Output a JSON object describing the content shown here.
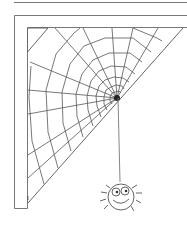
{
  "illustration": {
    "subject": "spider web in a corner with a hanging spider",
    "colors": {
      "background": "#ffffff",
      "line": "#6e6e6e",
      "web": "#555555",
      "center": "#222222"
    },
    "web": {
      "center": [
        117,
        98
      ],
      "rings": 9
    },
    "spider": {
      "position": [
        122,
        196
      ]
    }
  }
}
